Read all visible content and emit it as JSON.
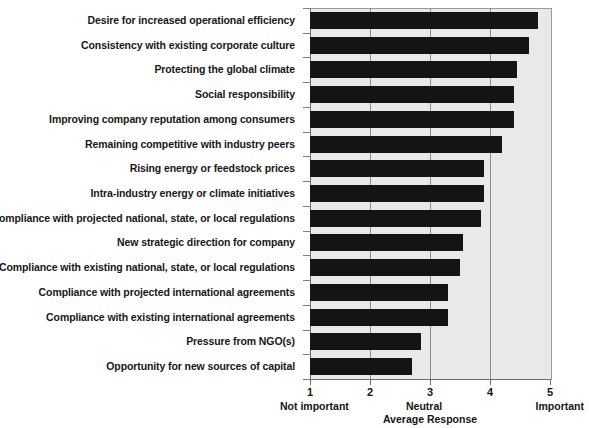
{
  "chart_data": {
    "type": "bar",
    "orientation": "horizontal",
    "title": "",
    "xlabel": "Average Response",
    "ylabel": "",
    "xlim": [
      1,
      5
    ],
    "xticks": [
      1,
      2,
      3,
      4,
      5
    ],
    "xtick_labels": [
      "1",
      "2",
      "3",
      "4",
      "5"
    ],
    "scale_anchors": [
      {
        "value": 1,
        "label": "Not important"
      },
      {
        "value": 3,
        "label": "Neutral"
      },
      {
        "value": 5,
        "label": "Important"
      }
    ],
    "grid": true,
    "gridlines_at": [
      2,
      3,
      4
    ],
    "legend": null,
    "bar_color": "#141414",
    "plot_background": "#e9e9e9",
    "categories": [
      "Desire for increased operational efficiency",
      "Consistency with existing corporate culture",
      "Protecting the global climate",
      "Social responsibility",
      "Improving company reputation among consumers",
      "Remaining competitive with industry peers",
      "Rising energy or feedstock prices",
      "Intra-industry energy or climate initiatives",
      "Compliance with projected national, state, or local regulations",
      "New strategic direction for company",
      "Compliance with existing national, state, or local regulations",
      "Compliance with projected international agreements",
      "Compliance with existing international agreements",
      "Pressure from NGO(s)",
      "Opportunity for new sources of capital"
    ],
    "values": [
      4.8,
      4.65,
      4.45,
      4.4,
      4.4,
      4.2,
      3.9,
      3.9,
      3.85,
      3.55,
      3.5,
      3.3,
      3.3,
      2.85,
      2.7
    ]
  }
}
